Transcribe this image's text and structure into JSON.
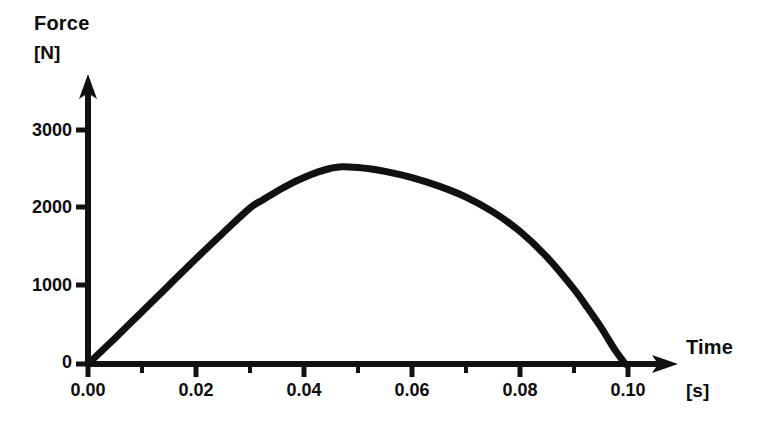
{
  "chart_data": {
    "type": "line",
    "title": "",
    "subtitle": "",
    "xlabel": "Time",
    "xunit": "[s]",
    "ylabel": "Force",
    "yunit": "[N]",
    "xlim": [
      0.0,
      0.104
    ],
    "ylim": [
      0,
      3400
    ],
    "grid": false,
    "legend": null,
    "x_ticks_major": [
      "0.00",
      "0.02",
      "0.04",
      "0.06",
      "0.08",
      "0.10"
    ],
    "x_tick_values": [
      0.0,
      0.02,
      0.04,
      0.06,
      0.08,
      0.1
    ],
    "x_minor_tick_values": [
      0.01,
      0.03,
      0.05,
      0.07,
      0.09
    ],
    "y_ticks_major": [
      "0",
      "1000",
      "2000",
      "3000"
    ],
    "y_tick_values": [
      0,
      1000,
      2000,
      3000
    ],
    "series": [
      {
        "name": "Force pulse",
        "x": [
          0.0,
          0.005,
          0.01,
          0.015,
          0.02,
          0.025,
          0.03,
          0.0325,
          0.035,
          0.0375,
          0.04,
          0.0425,
          0.045,
          0.047,
          0.05,
          0.0525,
          0.055,
          0.06,
          0.065,
          0.07,
          0.075,
          0.08,
          0.085,
          0.09,
          0.0925,
          0.095,
          0.0975,
          0.0995
        ],
        "values": [
          0,
          330,
          670,
          1010,
          1350,
          1680,
          2000,
          2110,
          2215,
          2310,
          2390,
          2460,
          2510,
          2530,
          2520,
          2500,
          2470,
          2390,
          2280,
          2140,
          1950,
          1700,
          1370,
          960,
          720,
          470,
          190,
          0
        ]
      }
    ],
    "annotations": []
  },
  "axes": {
    "y_arrow_name": "y-axis-arrow",
    "x_arrow_name": "x-axis-arrow"
  }
}
